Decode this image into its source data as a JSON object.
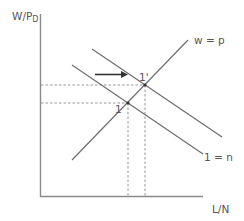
{
  "diagram": {
    "y_axis_label": "W/P",
    "y_axis_label_subscript": "D",
    "x_axis_label": "L/N",
    "curves": {
      "upward_line_label": "w = p",
      "downward_line_label": "1 = n"
    },
    "points": {
      "initial": "1",
      "shifted": "1'"
    },
    "colors": {
      "line": "#6e6e6e",
      "axis": "#8a8a8a",
      "dashed": "#8a8a8a",
      "text": "#555555",
      "arrow": "#333333"
    }
  }
}
